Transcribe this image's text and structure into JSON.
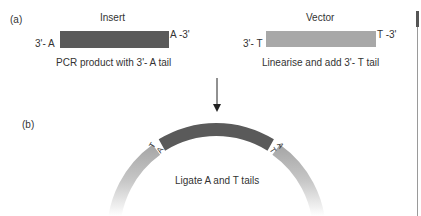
{
  "panel_a": {
    "label": "(a)",
    "insert": {
      "title": "Insert",
      "left_end": "3'- A",
      "right_end": "A -3'",
      "caption": "PCR product with 3'- A tail",
      "color": "#5a5a5a"
    },
    "vector": {
      "title": "Vector",
      "left_end": "3'- T",
      "right_end": "T -3'",
      "caption": "Linearise and add 3'- T tail",
      "color": "#a8a8a8"
    }
  },
  "arrow": {
    "icon": "arrow-down-icon"
  },
  "panel_b": {
    "label": "(b)",
    "caption": "Ligate A and T tails",
    "left_junction": {
      "outer": "T",
      "inner": "A"
    },
    "right_junction": {
      "outer": "A",
      "inner": "T"
    },
    "insert_color": "#5a5a5a",
    "vector_color": "#a8a8a8"
  }
}
